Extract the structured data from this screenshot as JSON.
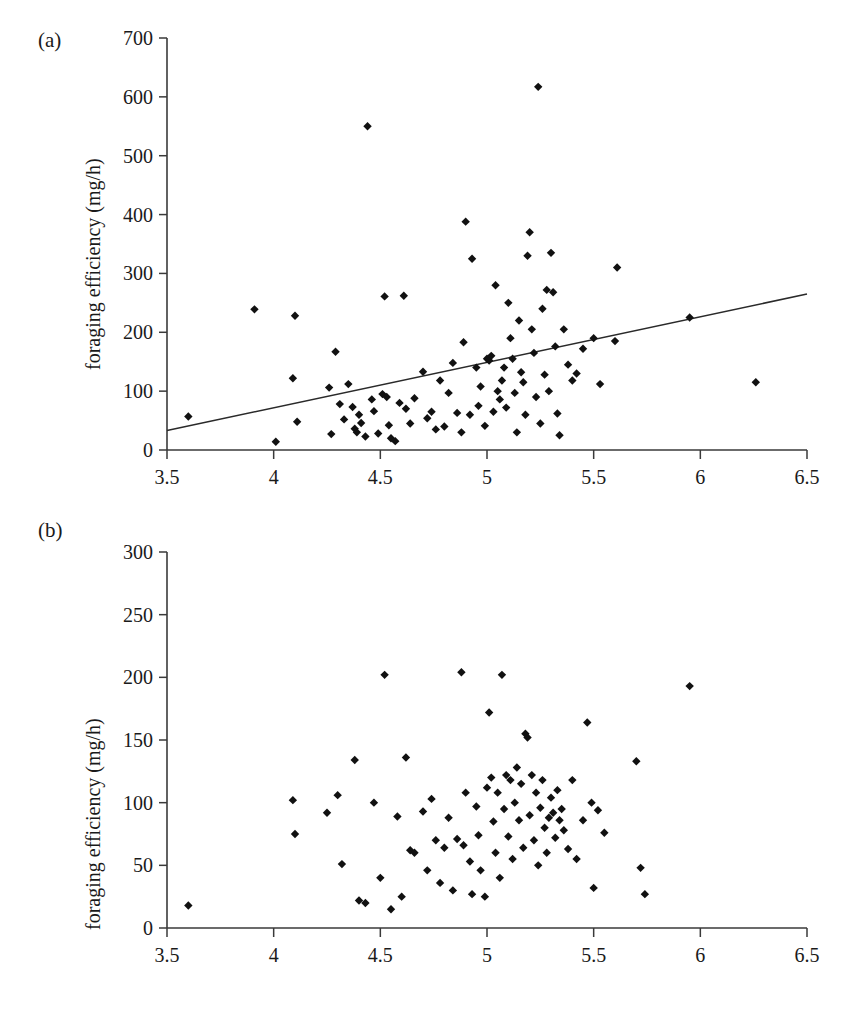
{
  "figure": {
    "panels": [
      {
        "id": "a",
        "label": "(a)",
        "ylabel": "foraging efficiency (mg/h)",
        "xlabel": ""
      },
      {
        "id": "b",
        "label": "(b)",
        "ylabel": "foraging efficiency (mg/h)",
        "xlabel": "thorax width (mm)"
      }
    ]
  },
  "chart_data": [
    {
      "type": "scatter",
      "panel": "(a)",
      "title": "",
      "xlabel": "",
      "ylabel": "foraging efficiency (mg/h)",
      "xlim": [
        3.5,
        6.5
      ],
      "ylim": [
        0,
        700
      ],
      "xticks": [
        3.5,
        4,
        4.5,
        5,
        5.5,
        6,
        6.5
      ],
      "xticklabels": [
        "3.5",
        "4",
        "4.5",
        "5",
        "5.5",
        "6",
        "6.5"
      ],
      "yticks": [
        0,
        100,
        200,
        300,
        400,
        500,
        600,
        700
      ],
      "yticklabels": [
        "0",
        "100",
        "200",
        "300",
        "400",
        "500",
        "600",
        "700"
      ],
      "grid": false,
      "legend": null,
      "marker": "diamond",
      "marker_color": "#111111",
      "trendline": {
        "type": "linear",
        "x": [
          3.5,
          6.5
        ],
        "y": [
          33,
          265
        ],
        "color": "#2a2a2a"
      },
      "points": [
        [
          3.6,
          57
        ],
        [
          3.91,
          239
        ],
        [
          4.01,
          14
        ],
        [
          4.09,
          122
        ],
        [
          4.1,
          228
        ],
        [
          4.11,
          48
        ],
        [
          4.26,
          106
        ],
        [
          4.27,
          27
        ],
        [
          4.29,
          167
        ],
        [
          4.31,
          78
        ],
        [
          4.33,
          52
        ],
        [
          4.35,
          112
        ],
        [
          4.37,
          73
        ],
        [
          4.38,
          36
        ],
        [
          4.39,
          30
        ],
        [
          4.4,
          60
        ],
        [
          4.41,
          46
        ],
        [
          4.43,
          23
        ],
        [
          4.44,
          550
        ],
        [
          4.46,
          86
        ],
        [
          4.47,
          66
        ],
        [
          4.49,
          28
        ],
        [
          4.51,
          95
        ],
        [
          4.52,
          261
        ],
        [
          4.53,
          90
        ],
        [
          4.54,
          42
        ],
        [
          4.55,
          20
        ],
        [
          4.57,
          15
        ],
        [
          4.59,
          80
        ],
        [
          4.61,
          262
        ],
        [
          4.62,
          70
        ],
        [
          4.64,
          45
        ],
        [
          4.66,
          88
        ],
        [
          4.7,
          133
        ],
        [
          4.72,
          54
        ],
        [
          4.74,
          65
        ],
        [
          4.76,
          35
        ],
        [
          4.78,
          118
        ],
        [
          4.8,
          40
        ],
        [
          4.82,
          97
        ],
        [
          4.84,
          148
        ],
        [
          4.86,
          63
        ],
        [
          4.88,
          30
        ],
        [
          4.89,
          183
        ],
        [
          4.9,
          388
        ],
        [
          4.92,
          60
        ],
        [
          4.93,
          325
        ],
        [
          4.95,
          140
        ],
        [
          4.96,
          75
        ],
        [
          4.97,
          108
        ],
        [
          4.99,
          41
        ],
        [
          5.0,
          155
        ],
        [
          5.01,
          152
        ],
        [
          5.02,
          160
        ],
        [
          5.03,
          65
        ],
        [
          5.04,
          280
        ],
        [
          5.05,
          100
        ],
        [
          5.06,
          86
        ],
        [
          5.07,
          118
        ],
        [
          5.08,
          140
        ],
        [
          5.09,
          72
        ],
        [
          5.1,
          250
        ],
        [
          5.11,
          190
        ],
        [
          5.12,
          155
        ],
        [
          5.13,
          97
        ],
        [
          5.14,
          30
        ],
        [
          5.15,
          220
        ],
        [
          5.16,
          132
        ],
        [
          5.17,
          115
        ],
        [
          5.18,
          60
        ],
        [
          5.19,
          330
        ],
        [
          5.2,
          370
        ],
        [
          5.21,
          205
        ],
        [
          5.22,
          165
        ],
        [
          5.23,
          90
        ],
        [
          5.24,
          617
        ],
        [
          5.25,
          45
        ],
        [
          5.26,
          240
        ],
        [
          5.27,
          128
        ],
        [
          5.28,
          272
        ],
        [
          5.29,
          100
        ],
        [
          5.3,
          335
        ],
        [
          5.31,
          268
        ],
        [
          5.32,
          176
        ],
        [
          5.33,
          62
        ],
        [
          5.34,
          25
        ],
        [
          5.36,
          205
        ],
        [
          5.38,
          145
        ],
        [
          5.4,
          118
        ],
        [
          5.42,
          130
        ],
        [
          5.45,
          172
        ],
        [
          5.5,
          190
        ],
        [
          5.53,
          112
        ],
        [
          5.6,
          185
        ],
        [
          5.61,
          310
        ],
        [
          5.95,
          225
        ],
        [
          6.26,
          115
        ]
      ]
    },
    {
      "type": "scatter",
      "panel": "(b)",
      "title": "",
      "xlabel": "thorax width (mm)",
      "ylabel": "foraging efficiency (mg/h)",
      "xlim": [
        3.5,
        6.5
      ],
      "ylim": [
        0,
        300
      ],
      "xticks": [
        3.5,
        4,
        4.5,
        5,
        5.5,
        6,
        6.5
      ],
      "xticklabels": [
        "3.5",
        "4",
        "4.5",
        "5",
        "5.5",
        "6",
        "6.5"
      ],
      "yticks": [
        0,
        50,
        100,
        150,
        200,
        250,
        300
      ],
      "yticklabels": [
        "0",
        "50",
        "100",
        "150",
        "200",
        "250",
        "300"
      ],
      "grid": false,
      "legend": null,
      "marker": "diamond",
      "marker_color": "#111111",
      "trendline": null,
      "points": [
        [
          3.6,
          18
        ],
        [
          4.09,
          102
        ],
        [
          4.1,
          75
        ],
        [
          4.25,
          92
        ],
        [
          4.3,
          106
        ],
        [
          4.32,
          51
        ],
        [
          4.38,
          134
        ],
        [
          4.4,
          22
        ],
        [
          4.43,
          20
        ],
        [
          4.47,
          100
        ],
        [
          4.5,
          40
        ],
        [
          4.52,
          202
        ],
        [
          4.55,
          15
        ],
        [
          4.58,
          89
        ],
        [
          4.6,
          25
        ],
        [
          4.62,
          136
        ],
        [
          4.64,
          62
        ],
        [
          4.66,
          60
        ],
        [
          4.7,
          93
        ],
        [
          4.72,
          46
        ],
        [
          4.74,
          103
        ],
        [
          4.76,
          70
        ],
        [
          4.78,
          36
        ],
        [
          4.8,
          64
        ],
        [
          4.82,
          88
        ],
        [
          4.84,
          30
        ],
        [
          4.86,
          71
        ],
        [
          4.88,
          204
        ],
        [
          4.89,
          66
        ],
        [
          4.9,
          108
        ],
        [
          4.92,
          53
        ],
        [
          4.93,
          27
        ],
        [
          4.95,
          97
        ],
        [
          4.96,
          74
        ],
        [
          4.97,
          46
        ],
        [
          4.99,
          25
        ],
        [
          5.0,
          112
        ],
        [
          5.01,
          172
        ],
        [
          5.02,
          120
        ],
        [
          5.03,
          85
        ],
        [
          5.04,
          60
        ],
        [
          5.05,
          108
        ],
        [
          5.06,
          40
        ],
        [
          5.07,
          202
        ],
        [
          5.08,
          95
        ],
        [
          5.09,
          122
        ],
        [
          5.1,
          73
        ],
        [
          5.11,
          118
        ],
        [
          5.12,
          55
        ],
        [
          5.13,
          100
        ],
        [
          5.14,
          128
        ],
        [
          5.15,
          86
        ],
        [
          5.16,
          115
        ],
        [
          5.17,
          64
        ],
        [
          5.18,
          155
        ],
        [
          5.19,
          152
        ],
        [
          5.2,
          90
        ],
        [
          5.21,
          122
        ],
        [
          5.22,
          70
        ],
        [
          5.23,
          108
        ],
        [
          5.24,
          50
        ],
        [
          5.25,
          96
        ],
        [
          5.26,
          118
        ],
        [
          5.27,
          80
        ],
        [
          5.28,
          60
        ],
        [
          5.29,
          88
        ],
        [
          5.3,
          104
        ],
        [
          5.31,
          92
        ],
        [
          5.32,
          72
        ],
        [
          5.33,
          110
        ],
        [
          5.34,
          86
        ],
        [
          5.35,
          95
        ],
        [
          5.36,
          78
        ],
        [
          5.38,
          63
        ],
        [
          5.4,
          118
        ],
        [
          5.42,
          55
        ],
        [
          5.45,
          86
        ],
        [
          5.47,
          164
        ],
        [
          5.49,
          100
        ],
        [
          5.5,
          32
        ],
        [
          5.52,
          94
        ],
        [
          5.55,
          76
        ],
        [
          5.7,
          133
        ],
        [
          5.72,
          48
        ],
        [
          5.74,
          27
        ],
        [
          5.95,
          193
        ]
      ]
    }
  ]
}
